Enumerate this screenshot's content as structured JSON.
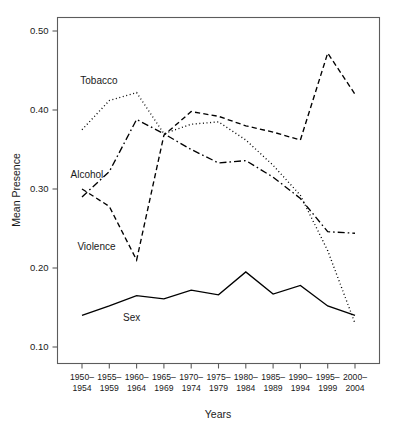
{
  "chart_data": {
    "type": "line",
    "title": "",
    "xlabel": "Years",
    "ylabel": "Mean Presence",
    "categories": [
      "1950–\n1954",
      "1955–\n1959",
      "1960–\n1964",
      "1965–\n1969",
      "1970–\n1974",
      "1975–\n1979",
      "1980–\n1984",
      "1985–\n1989",
      "1990–\n1994",
      "1995–\n1999",
      "2000–\n2004"
    ],
    "categories_top": [
      "1950–",
      "1955–",
      "1960–",
      "1965–",
      "1970–",
      "1975–",
      "1980–",
      "1985–",
      "1990–",
      "1995–",
      "2000–"
    ],
    "categories_bottom": [
      "1954",
      "1959",
      "1964",
      "1969",
      "1974",
      "1979",
      "1984",
      "1989",
      "1994",
      "1999",
      "2004"
    ],
    "ylim": [
      0.08,
      0.52
    ],
    "yticks": [
      0.1,
      0.2,
      0.3,
      0.4,
      0.5
    ],
    "ytick_labels": [
      "0.10",
      "0.20",
      "0.30",
      "0.40",
      "0.50"
    ],
    "grid": false,
    "legend": "inline-labels",
    "series": [
      {
        "name": "Tobacco",
        "style": "dotted",
        "dasharray": "1,2.6",
        "label_x": 0.62,
        "label_y": 0.437,
        "values": [
          0.375,
          0.412,
          0.422,
          0.37,
          0.382,
          0.385,
          0.362,
          0.33,
          0.292,
          0.222,
          0.13
        ]
      },
      {
        "name": "Alcohol",
        "style": "dash-dot",
        "dasharray": "7,3,1.6,3",
        "label_x": 0.18,
        "label_y": 0.318,
        "values": [
          0.29,
          0.322,
          0.388,
          0.37,
          0.35,
          0.333,
          0.336,
          0.315,
          0.288,
          0.246,
          0.244
        ]
      },
      {
        "name": "Violence",
        "style": "dashed",
        "dasharray": "5.2,3.2",
        "label_x": 0.53,
        "label_y": 0.227,
        "values": [
          0.3,
          0.278,
          0.21,
          0.368,
          0.398,
          0.392,
          0.38,
          0.372,
          0.362,
          0.472,
          0.42
        ]
      },
      {
        "name": "Sex",
        "style": "solid",
        "dasharray": "none",
        "label_x": 1.82,
        "label_y": 0.137,
        "values": [
          0.14,
          0.152,
          0.165,
          0.161,
          0.172,
          0.166,
          0.195,
          0.167,
          0.178,
          0.152,
          0.14
        ]
      }
    ]
  },
  "colors": {
    "line": "#000000",
    "frame": "#5c5c5c",
    "text": "#1a1a1a",
    "background": "#ffffff"
  }
}
